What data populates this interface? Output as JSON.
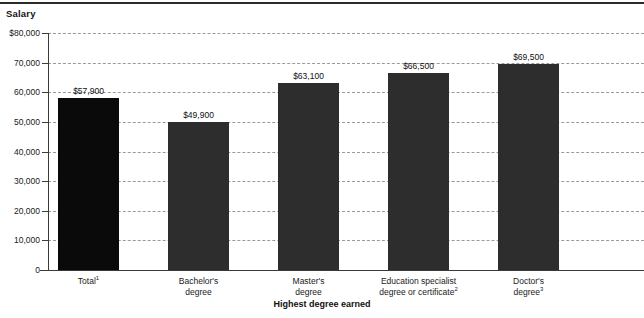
{
  "chart_data": {
    "type": "bar",
    "title": "",
    "ylabel": "Salary",
    "xlabel": "Highest degree earned",
    "ylim": [
      0,
      80000
    ],
    "ytick_labels": [
      "$80,000",
      "70,000",
      "60,000",
      "50,000",
      "40,000",
      "30,000",
      "20,000",
      "10,000",
      "0"
    ],
    "ytick_values": [
      80000,
      70000,
      60000,
      50000,
      40000,
      30000,
      20000,
      10000,
      0
    ],
    "grid": "horizontal-dashed",
    "legend": "none",
    "categories": [
      "Total",
      "Bachelor's degree",
      "Master's degree",
      "Education specialist degree or certificate",
      "Doctor's degree"
    ],
    "category_lines": [
      [
        "Total"
      ],
      [
        "Bachelor's",
        "degree"
      ],
      [
        "Master's",
        "degree"
      ],
      [
        "Education specialist",
        "degree or certificate"
      ],
      [
        "Doctor's",
        "degree"
      ]
    ],
    "category_footnotes": [
      "1",
      "",
      "",
      "2",
      "3"
    ],
    "values": [
      57900,
      49900,
      63100,
      66500,
      69500
    ],
    "value_labels": [
      "$57,900",
      "$49,900",
      "$63,100",
      "$66,500",
      "$69,500"
    ],
    "bar_colors": [
      "#0a0a0a",
      "#2d2d2d",
      "#2d2d2d",
      "#2d2d2d",
      "#2d2d2d"
    ]
  }
}
